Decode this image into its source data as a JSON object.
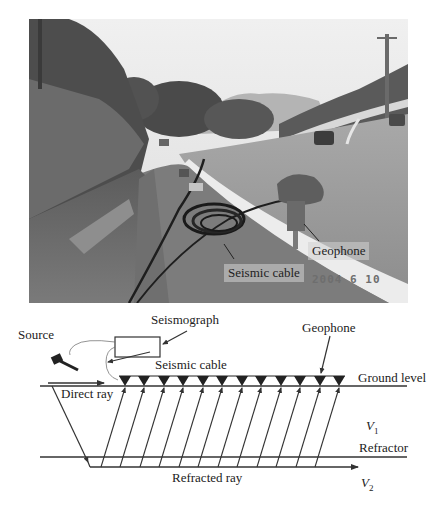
{
  "photo": {
    "labels": {
      "geophone": "Geophone",
      "seismic_cable": "Seismic cable"
    },
    "date_stamp": "2004 6 10"
  },
  "diagram": {
    "labels": {
      "source": "Source",
      "seismograph": "Seismograph",
      "geophone": "Geophone",
      "seismic_cable": "Seismic cable",
      "ground_level": "Ground level",
      "direct_ray": "Direct ray",
      "v1_symbol": "V",
      "v1_sub": "1",
      "refractor": "Refractor",
      "refracted_ray": "Refracted ray",
      "v2_symbol": "V",
      "v2_sub": "2"
    },
    "geophone_count": 12,
    "colors": {
      "line": "#333333",
      "fill": "#222222"
    }
  }
}
